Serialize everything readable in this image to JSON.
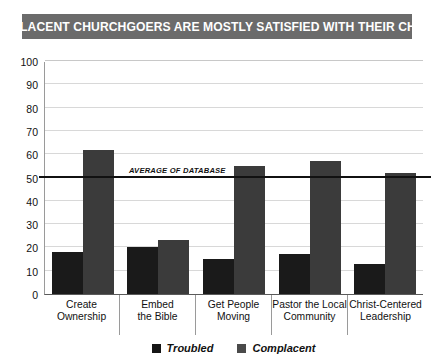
{
  "title": "COMPLACENT CHURCHGOERS ARE MOSTLY SATISFIED WITH THEIR CHURCH",
  "chart_number": "CHART 3.2",
  "annotation": {
    "average_label": "AVERAGE OF DATABASE",
    "average_value": 50
  },
  "legend": {
    "items": [
      {
        "label": "Troubled",
        "color": "#151515"
      },
      {
        "label": "Complacent",
        "color": "#4a4a4a"
      }
    ]
  },
  "axis": {
    "ticks": [
      "100",
      "90",
      "80",
      "70",
      "60",
      "50",
      "40",
      "30",
      "20",
      "10",
      "0"
    ]
  },
  "categories_lines": [
    {
      "l1": "Create",
      "l2": "Ownership"
    },
    {
      "l1": "Embed",
      "l2": "the Bible"
    },
    {
      "l1": "Get People",
      "l2": "Moving"
    },
    {
      "l1": "Pastor the Local",
      "l2": "Community"
    },
    {
      "l1": "Christ-Centered",
      "l2": "Leadership"
    }
  ],
  "chart_data": {
    "type": "bar",
    "title": "COMPLACENT CHURCHGOERS ARE MOSTLY SATISFIED WITH THEIR CHURCH",
    "xlabel": "",
    "ylabel": "",
    "ylim": [
      0,
      100
    ],
    "yticks": [
      0,
      10,
      20,
      30,
      40,
      50,
      60,
      70,
      80,
      90,
      100
    ],
    "grid": true,
    "legend_position": "bottom",
    "categories": [
      "Create Ownership",
      "Embed the Bible",
      "Get People Moving",
      "Pastor the Local Community",
      "Christ-Centered Leadership"
    ],
    "series": [
      {
        "name": "Troubled",
        "color": "#1a1a1a",
        "values": [
          18,
          20,
          15,
          17,
          13
        ]
      },
      {
        "name": "Complacent",
        "color": "#3b3b3b",
        "values": [
          62,
          23,
          55,
          57,
          52
        ]
      }
    ],
    "annotations": [
      {
        "type": "hline",
        "label": "AVERAGE OF DATABASE",
        "value": 50
      }
    ],
    "chart_number": "CHART 3.2"
  }
}
